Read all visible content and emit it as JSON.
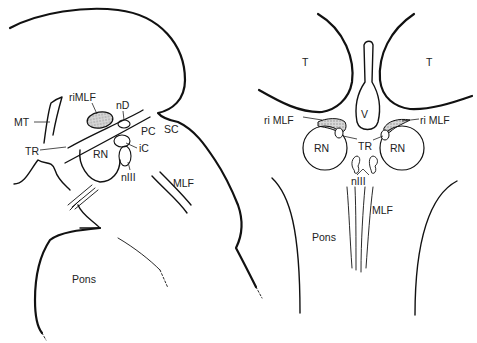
{
  "figure": {
    "left_panel": {
      "view": "sagittal",
      "labels": {
        "riMLF": "riMLF",
        "nD": "nD",
        "MT": "MT",
        "PC": "PC",
        "SC": "SC",
        "TR": "TR",
        "RN": "RN",
        "iC": "iC",
        "nIII": "nIII",
        "MLF": "MLF",
        "Pons": "Pons"
      }
    },
    "right_panel": {
      "view": "coronal",
      "labels": {
        "T_left": "T",
        "T_right": "T",
        "V": "V",
        "riMLF_left": "ri MLF",
        "riMLF_right": "ri MLF",
        "TR": "TR",
        "RN_left": "RN",
        "RN_right": "RN",
        "nIII": "nIII",
        "MLF": "MLF",
        "Pons": "Pons"
      }
    },
    "colors": {
      "line": "#111111",
      "text": "#222222",
      "stipple": "#999999",
      "background": "#ffffff"
    }
  }
}
